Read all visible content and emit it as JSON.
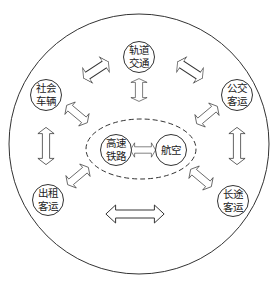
{
  "diagram": {
    "outer_circle": {
      "cx": 139,
      "cy": 144,
      "r": 130
    },
    "core_group": {
      "cx": 141,
      "cy": 149,
      "rx": 55,
      "ry": 30,
      "style": "dashed"
    },
    "nodes": [
      {
        "id": "rail-transit",
        "line1": "轨道",
        "line2": "交通",
        "cx": 139,
        "cy": 57
      },
      {
        "id": "private-vehicles",
        "line1": "社会",
        "line2": "车辆",
        "cx": 46,
        "cy": 95
      },
      {
        "id": "public-bus",
        "line1": "公交",
        "line2": "客运",
        "cx": 237,
        "cy": 95
      },
      {
        "id": "taxi",
        "line1": "出租",
        "line2": "客运",
        "cx": 48,
        "cy": 200
      },
      {
        "id": "long-distance-bus",
        "line1": "长途",
        "line2": "客运",
        "cx": 233,
        "cy": 201
      },
      {
        "id": "high-speed-rail",
        "line1": "高速",
        "line2": "铁路",
        "cx": 116,
        "cy": 150
      },
      {
        "id": "aviation",
        "line1": "航空",
        "line2": "",
        "cx": 171,
        "cy": 150
      }
    ],
    "connections": [
      {
        "from": "private-vehicles",
        "to": "rail-transit"
      },
      {
        "from": "rail-transit",
        "to": "public-bus"
      },
      {
        "from": "rail-transit",
        "to": "core-group"
      },
      {
        "from": "private-vehicles",
        "to": "core-group"
      },
      {
        "from": "public-bus",
        "to": "core-group"
      },
      {
        "from": "private-vehicles",
        "to": "taxi"
      },
      {
        "from": "public-bus",
        "to": "long-distance-bus"
      },
      {
        "from": "taxi",
        "to": "core-group"
      },
      {
        "from": "long-distance-bus",
        "to": "core-group"
      },
      {
        "from": "taxi",
        "to": "long-distance-bus"
      },
      {
        "from": "high-speed-rail",
        "to": "aviation"
      }
    ],
    "colors": {
      "stroke": "#333333",
      "fill": "#ffffff",
      "text": "#222222"
    }
  }
}
